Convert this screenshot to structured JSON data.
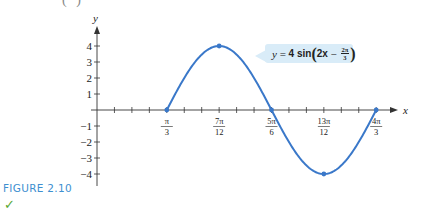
{
  "page": {
    "top_fragment": "(      )",
    "figure_label": "FIGURE 2.10",
    "check_icon": "check-mark-icon"
  },
  "equation": {
    "lhs": "y",
    "eq": "=",
    "coef": "4",
    "func": "sin",
    "arg_var": "2x",
    "minus": "−",
    "frac_num": "2π",
    "frac_den": "3"
  },
  "colors": {
    "curve": "#3a78c9",
    "axis": "#333333",
    "label_bg": "#d9ecf8",
    "figure_label": "#3d8fd0"
  },
  "chart_data": {
    "type": "line",
    "xlabel": "x",
    "ylabel": "y",
    "x_ticks": [
      "π/3",
      "7π/12",
      "5π/6",
      "13π/12",
      "4π/3"
    ],
    "x_tick_values": [
      1.0472,
      1.8326,
      2.618,
      3.4034,
      4.1888
    ],
    "y_ticks": [
      -4,
      -3,
      -2,
      -1,
      1,
      2,
      3,
      4
    ],
    "ylim": [
      -4.5,
      5
    ],
    "xlim": [
      0,
      4.5
    ],
    "series": [
      {
        "name": "y = 4 sin(2x − 2π/3)",
        "function": "4*sin(2*x - 2*pi/3)",
        "domain": [
          1.0472,
          4.1888
        ],
        "key_points": [
          {
            "x": "π/3",
            "y": 0
          },
          {
            "x": "7π/12",
            "y": 4
          },
          {
            "x": "5π/6",
            "y": 0
          },
          {
            "x": "13π/12",
            "y": -4
          },
          {
            "x": "4π/3",
            "y": 0
          }
        ]
      }
    ],
    "grid": false,
    "legend": "annotation box near peak"
  }
}
